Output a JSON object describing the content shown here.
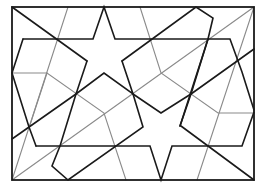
{
  "figure": {
    "colors": {
      "background": "#ffffff",
      "primary_lines": "#1a1a1a",
      "construction_lines": "#8a8a8a"
    },
    "frame": {
      "x1": 12,
      "y1": 7,
      "x2": 254,
      "y2": 180
    },
    "black_paths": [
      "M12,7 L87,61",
      "M23,39 L93,39 L104,7 L115,39 L230,39 L242,72 L254,88",
      "M23,39 L12,73 L29,126 L36,146",
      "M36,146 L143,146",
      "M87,61 L76,93 L60,146 L52,166 L68,180 L143,127",
      "M143,127 L133,94 L104,73 L76,93",
      "M12,139 L76,93",
      "M133,94 L161,112 L191,94 L196,180",
      "M122,61 L196,7 L213,18 L208,39 L180,126 L209,146",
      "M122,61 L133,94",
      "M191,94 L254,49",
      "M254,49 L254,112 L242,146",
      "M143,146 L242,146",
      "M161,146 L171,180 L180,146",
      "M209,146 L254,180",
      "M115,146 L143,127"
    ],
    "gray_paths": [
      "M12,180 L254,7",
      "M12,180 L68,7",
      "M12,73 L47,73 L104,113 L115,146 L126,180",
      "M140,7 L152,39 L161,73 L218,113 L254,113",
      "M47,73 L29,126",
      "M161,73 L254,7",
      "M197,180 L236,60",
      "M218,113 L242,60"
    ]
  }
}
